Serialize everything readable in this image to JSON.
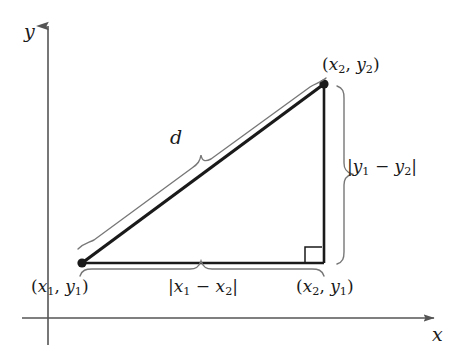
{
  "figure": {
    "background_color": "#ffffff",
    "line_color": "#1a1a1a",
    "axis_color": "#555555"
  },
  "axes": {
    "y_label": "y",
    "x_label": "x"
  },
  "labels": {
    "point2": {
      "open": "(",
      "x_var": "x",
      "x_sub": "2",
      "comma": ", ",
      "y_var": "y",
      "y_sub": "2",
      "close": ")"
    },
    "point1": {
      "open": "(",
      "x_var": "x",
      "x_sub": "1",
      "comma": ", ",
      "y_var": "y",
      "y_sub": "1",
      "close": ")"
    },
    "corner": {
      "open": "(",
      "x_var": "x",
      "x_sub": "2",
      "comma": ", ",
      "y_var": "y",
      "y_sub": "1",
      "close": ")"
    },
    "vertical_leg": {
      "open": "|",
      "a_var": "y",
      "a_sub": "1",
      "minus": " − ",
      "b_var": "y",
      "b_sub": "2",
      "close": "|"
    },
    "horizontal_leg": {
      "open": "|",
      "a_var": "x",
      "a_sub": "1",
      "minus": " − ",
      "b_var": "x",
      "b_sub": "2",
      "close": "|"
    },
    "hypotenuse": "d"
  },
  "geometry": {
    "vertex_point1": {
      "x": 82,
      "y": 263
    },
    "vertex_point2": {
      "x": 324,
      "y": 84
    },
    "vertex_corner": {
      "x": 324,
      "y": 263
    },
    "y_axis_x": 48,
    "x_axis_y": 318,
    "right_angle_marker": true
  }
}
